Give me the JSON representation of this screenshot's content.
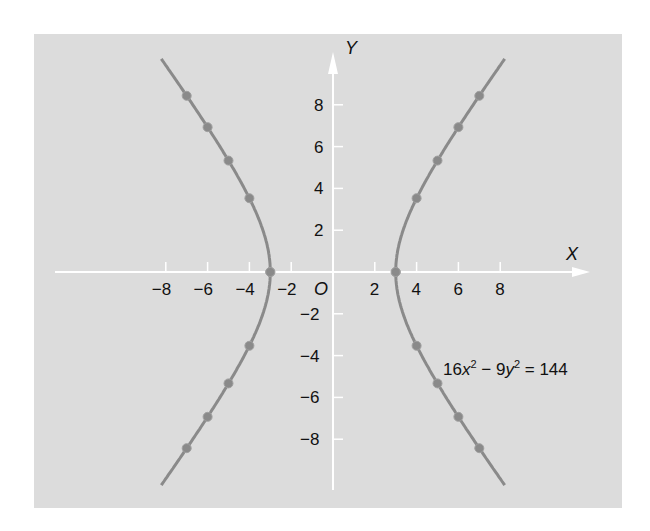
{
  "chart_data": {
    "type": "line",
    "title": "",
    "equation": "16x² − 9y² = 144",
    "equation_parts": {
      "a": "16x",
      "b": " − 9y",
      "c": " = 144",
      "sup": "2"
    },
    "xlabel": "X",
    "ylabel": "Y",
    "origin_label": "O",
    "xlim": [
      -10,
      10
    ],
    "ylim": [
      -10,
      10
    ],
    "x_ticks": [
      -8,
      -6,
      -4,
      -2,
      2,
      4,
      6,
      8
    ],
    "x_tick_labels": [
      "−8",
      "−6",
      "−4",
      "−2",
      "2",
      "4",
      "6",
      "8"
    ],
    "y_ticks": [
      8,
      6,
      4,
      2,
      -2,
      -4,
      -6,
      -8
    ],
    "y_tick_labels": [
      "8",
      "6",
      "4",
      "2",
      "−2",
      "−4",
      "−6",
      "−8"
    ],
    "grid": false,
    "series": [
      {
        "name": "right branch",
        "x": [
          3,
          4,
          5,
          6,
          7
        ],
        "y_pos": [
          0,
          3.53,
          5.33,
          6.93,
          8.43
        ],
        "y_neg": [
          0,
          -3.53,
          -5.33,
          -6.93,
          -8.43
        ]
      },
      {
        "name": "left branch",
        "x": [
          -3,
          -4,
          -5,
          -6,
          -7
        ],
        "y_pos": [
          0,
          3.53,
          5.33,
          6.93,
          8.43
        ],
        "y_neg": [
          0,
          -3.53,
          -5.33,
          -6.93,
          -8.43
        ]
      }
    ],
    "colors": {
      "background": "#dcdcdc",
      "curve": "#8a8a8a",
      "axis": "#ffffff",
      "text": "#111111"
    }
  }
}
